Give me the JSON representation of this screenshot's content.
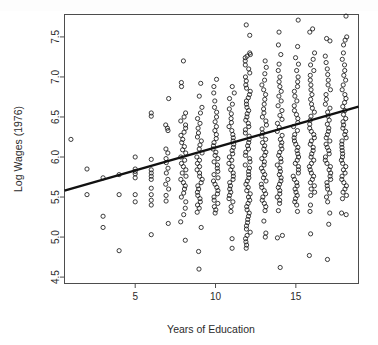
{
  "chart_data": {
    "type": "scatter",
    "title": "",
    "xlabel": "Years of Education",
    "ylabel": "Log Wages (1976)",
    "xlim": [
      0.6,
      18.9
    ],
    "ylim": [
      4.42,
      7.78
    ],
    "xticks": [
      5,
      10,
      15
    ],
    "xtick_labels": [
      "5",
      "10",
      "15"
    ],
    "yticks": [
      4.5,
      5.0,
      5.5,
      6.0,
      6.5,
      7.0,
      7.5
    ],
    "ytick_labels": [
      "4.5",
      "5.0",
      "5.5",
      "6.0",
      "6.5",
      "7.0",
      "7.5"
    ],
    "grid": false,
    "legend": false,
    "marker": "open-circle",
    "marker_color": "#1a1a1a",
    "box_color": "#4d4d4d",
    "fit_line": {
      "label": "regression line",
      "color": "#111111",
      "width": 2.4,
      "intercept": 5.545,
      "slope": 0.0575,
      "x_start": 0.6,
      "x_end": 18.9,
      "y_start": 5.58,
      "y_end": 6.63
    },
    "columns": [
      {
        "x": 1,
        "values": [
          6.22
        ]
      },
      {
        "x": 2,
        "values": [
          5.85,
          5.53
        ]
      },
      {
        "x": 3,
        "values": [
          5.74,
          5.26,
          5.12
        ]
      },
      {
        "x": 4,
        "values": [
          5.78,
          5.53,
          4.83
        ]
      },
      {
        "x": 5,
        "values": [
          6.0,
          5.85,
          5.82,
          5.79,
          5.74,
          5.53,
          5.44
        ]
      },
      {
        "x": 6,
        "values": [
          6.55,
          6.51,
          5.97,
          5.84,
          5.8,
          5.76,
          5.72,
          5.61,
          5.53,
          5.46,
          5.4,
          5.03
        ]
      },
      {
        "x": 7,
        "values": [
          6.73,
          6.4,
          6.36,
          6.33,
          6.1,
          6.05,
          5.98,
          5.93,
          5.86,
          5.8,
          5.72,
          5.66,
          5.6,
          5.52,
          5.45,
          5.17
        ]
      },
      {
        "x": 8,
        "values": [
          7.2,
          6.93,
          6.88,
          6.55,
          6.5,
          6.45,
          6.4,
          6.36,
          6.31,
          6.27,
          6.22,
          6.18,
          6.13,
          6.09,
          6.05,
          6.0,
          5.96,
          5.92,
          5.88,
          5.84,
          5.8,
          5.76,
          5.72,
          5.68,
          5.64,
          5.6,
          5.55,
          5.5,
          5.44,
          5.36,
          5.28,
          5.19,
          4.96
        ]
      },
      {
        "x": 9,
        "values": [
          6.92,
          6.76,
          6.62,
          6.55,
          6.48,
          6.42,
          6.36,
          6.3,
          6.25,
          6.2,
          6.15,
          6.1,
          6.05,
          6.0,
          5.96,
          5.92,
          5.88,
          5.84,
          5.8,
          5.76,
          5.72,
          5.68,
          5.64,
          5.6,
          5.56,
          5.52,
          5.48,
          5.44,
          5.4,
          5.36,
          5.31,
          5.12,
          4.82,
          4.6
        ]
      },
      {
        "x": 10,
        "values": [
          6.97,
          6.88,
          6.8,
          6.7,
          6.62,
          6.56,
          6.5,
          6.44,
          6.38,
          6.33,
          6.28,
          6.23,
          6.18,
          6.14,
          6.1,
          6.06,
          6.02,
          5.98,
          5.94,
          5.9,
          5.86,
          5.82,
          5.78,
          5.74,
          5.7,
          5.66,
          5.62,
          5.58,
          5.54,
          5.5,
          5.46,
          5.42,
          5.38,
          5.34,
          5.3
        ]
      },
      {
        "x": 11,
        "values": [
          6.88,
          6.8,
          6.73,
          6.66,
          6.6,
          6.54,
          6.48,
          6.43,
          6.38,
          6.33,
          6.28,
          6.24,
          6.2,
          6.16,
          6.12,
          6.08,
          6.04,
          6.0,
          5.96,
          5.92,
          5.88,
          5.84,
          5.8,
          5.76,
          5.72,
          5.68,
          5.64,
          5.6,
          5.56,
          5.52,
          5.48,
          5.44,
          5.38,
          5.32,
          4.98,
          4.86
        ]
      },
      {
        "x": 12,
        "values": [
          7.65,
          7.52,
          7.3,
          7.28,
          7.26,
          7.24,
          7.2,
          7.15,
          7.1,
          7.05,
          7.0,
          6.95,
          6.9,
          6.86,
          6.82,
          6.78,
          6.74,
          6.7,
          6.66,
          6.62,
          6.58,
          6.54,
          6.5,
          6.46,
          6.42,
          6.38,
          6.34,
          6.3,
          6.26,
          6.22,
          6.18,
          6.14,
          6.1,
          6.06,
          6.02,
          5.98,
          5.94,
          5.9,
          5.86,
          5.82,
          5.78,
          5.74,
          5.7,
          5.66,
          5.62,
          5.58,
          5.54,
          5.5,
          5.46,
          5.42,
          5.38,
          5.34,
          5.3,
          5.26,
          5.22,
          5.18,
          5.14,
          5.1,
          5.06,
          5.02,
          4.98,
          4.94,
          4.9,
          4.86
        ]
      },
      {
        "x": 13,
        "values": [
          7.2,
          7.12,
          7.04,
          6.96,
          6.9,
          6.84,
          6.78,
          6.72,
          6.66,
          6.6,
          6.55,
          6.5,
          6.45,
          6.4,
          6.35,
          6.3,
          6.26,
          6.22,
          6.18,
          6.14,
          6.1,
          6.06,
          6.02,
          5.98,
          5.94,
          5.9,
          5.86,
          5.82,
          5.78,
          5.74,
          5.7,
          5.66,
          5.62,
          5.58,
          5.54,
          5.5,
          5.46,
          5.42,
          5.38,
          5.33,
          5.2,
          5.05,
          5.0
        ]
      },
      {
        "x": 14,
        "values": [
          7.56,
          7.4,
          7.28,
          7.16,
          7.08,
          7.0,
          6.94,
          6.88,
          6.82,
          6.76,
          6.7,
          6.64,
          6.58,
          6.52,
          6.47,
          6.42,
          6.37,
          6.32,
          6.27,
          6.22,
          6.18,
          6.14,
          6.1,
          6.06,
          6.02,
          5.98,
          5.94,
          5.9,
          5.86,
          5.82,
          5.78,
          5.74,
          5.7,
          5.66,
          5.62,
          5.58,
          5.54,
          5.5,
          5.46,
          5.42,
          5.33,
          5.02,
          4.99,
          4.62
        ]
      },
      {
        "x": 15,
        "values": [
          7.71,
          7.38,
          7.24,
          7.16,
          7.08,
          7.0,
          6.94,
          6.88,
          6.82,
          6.76,
          6.7,
          6.64,
          6.58,
          6.53,
          6.48,
          6.43,
          6.38,
          6.33,
          6.28,
          6.24,
          6.2,
          6.16,
          6.12,
          6.08,
          6.04,
          6.0,
          5.96,
          5.92,
          5.88,
          5.84,
          5.8,
          5.76,
          5.72,
          5.68,
          5.64,
          5.6,
          5.56,
          5.52,
          5.48,
          5.44,
          5.4,
          5.32
        ]
      },
      {
        "x": 16,
        "values": [
          7.6,
          7.56,
          7.3,
          7.22,
          7.15,
          7.08,
          7.02,
          6.96,
          6.9,
          6.84,
          6.78,
          6.72,
          6.66,
          6.61,
          6.56,
          6.51,
          6.46,
          6.41,
          6.36,
          6.32,
          6.28,
          6.24,
          6.2,
          6.16,
          6.12,
          6.08,
          6.04,
          6.0,
          5.96,
          5.92,
          5.88,
          5.84,
          5.8,
          5.76,
          5.72,
          5.68,
          5.64,
          5.6,
          5.56,
          5.52,
          5.4,
          5.32,
          5.04,
          4.77
        ]
      },
      {
        "x": 17,
        "values": [
          7.48,
          7.45,
          7.26,
          7.18,
          7.1,
          7.03,
          6.96,
          6.9,
          6.84,
          6.78,
          6.72,
          6.66,
          6.61,
          6.56,
          6.51,
          6.46,
          6.41,
          6.36,
          6.32,
          6.28,
          6.24,
          6.2,
          6.16,
          6.12,
          6.08,
          6.04,
          6.0,
          5.96,
          5.92,
          5.88,
          5.84,
          5.8,
          5.76,
          5.72,
          5.68,
          5.64,
          5.6,
          5.55,
          5.5,
          5.44,
          5.3,
          5.16,
          4.72
        ]
      },
      {
        "x": 18,
        "values": [
          7.76,
          7.5,
          7.46,
          7.4,
          7.3,
          7.22,
          7.15,
          7.08,
          7.02,
          6.96,
          6.9,
          6.84,
          6.78,
          6.73,
          6.68,
          6.63,
          6.58,
          6.53,
          6.48,
          6.44,
          6.4,
          6.36,
          6.32,
          6.28,
          6.24,
          6.2,
          6.16,
          6.12,
          6.08,
          6.04,
          6.0,
          5.96,
          5.92,
          5.88,
          5.84,
          5.8,
          5.76,
          5.72,
          5.68,
          5.64,
          5.6,
          5.56,
          5.52,
          5.48,
          5.3,
          5.28
        ]
      }
    ]
  }
}
